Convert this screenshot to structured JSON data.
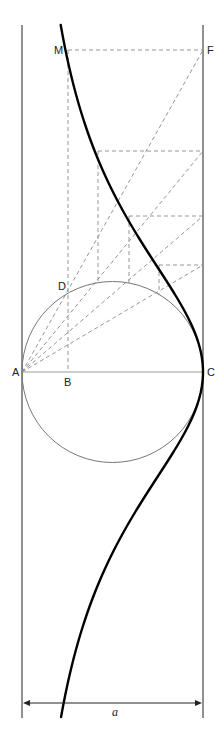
{
  "diagram": {
    "colors": {
      "background": "#ffffff",
      "frame": "#222222",
      "curve": "#000000",
      "circle": "#777777",
      "construction": "#8a8a8a",
      "diameter": "#999999"
    },
    "frame": {
      "left_x": 22,
      "right_x": 203,
      "top_y": 25,
      "bottom_y": 718
    },
    "axis_y": 372,
    "circle": {
      "cx": 112.5,
      "cy": 372,
      "r": 90.5
    },
    "points": {
      "A": {
        "x": 22,
        "y": 372,
        "label": "A",
        "lx": 12,
        "ly": 376
      },
      "B": {
        "x": 68,
        "y": 372,
        "label": "B",
        "lx": 64,
        "ly": 386
      },
      "C": {
        "x": 203,
        "y": 372,
        "label": "C",
        "lx": 207,
        "ly": 376
      },
      "D": {
        "x": 68,
        "y": 291,
        "label": "D",
        "lx": 58,
        "ly": 290
      },
      "M": {
        "x": 68,
        "y": 50,
        "label": "M",
        "lx": 54,
        "ly": 54
      },
      "F": {
        "x": 203,
        "y": 50,
        "label": "F",
        "lx": 207,
        "ly": 54
      }
    },
    "construction_rows": [
      {
        "y": 50,
        "x_from": 68
      },
      {
        "y": 151,
        "x_from": 98
      },
      {
        "y": 216,
        "x_from": 129
      },
      {
        "y": 265,
        "x_from": 159
      }
    ],
    "curve": {
      "type": "witch-of-agnesi",
      "a": 181,
      "y_top": 25,
      "y_bottom": 718
    },
    "dimension": {
      "y": 703,
      "label": "a",
      "lx": 112,
      "ly": 716
    }
  }
}
